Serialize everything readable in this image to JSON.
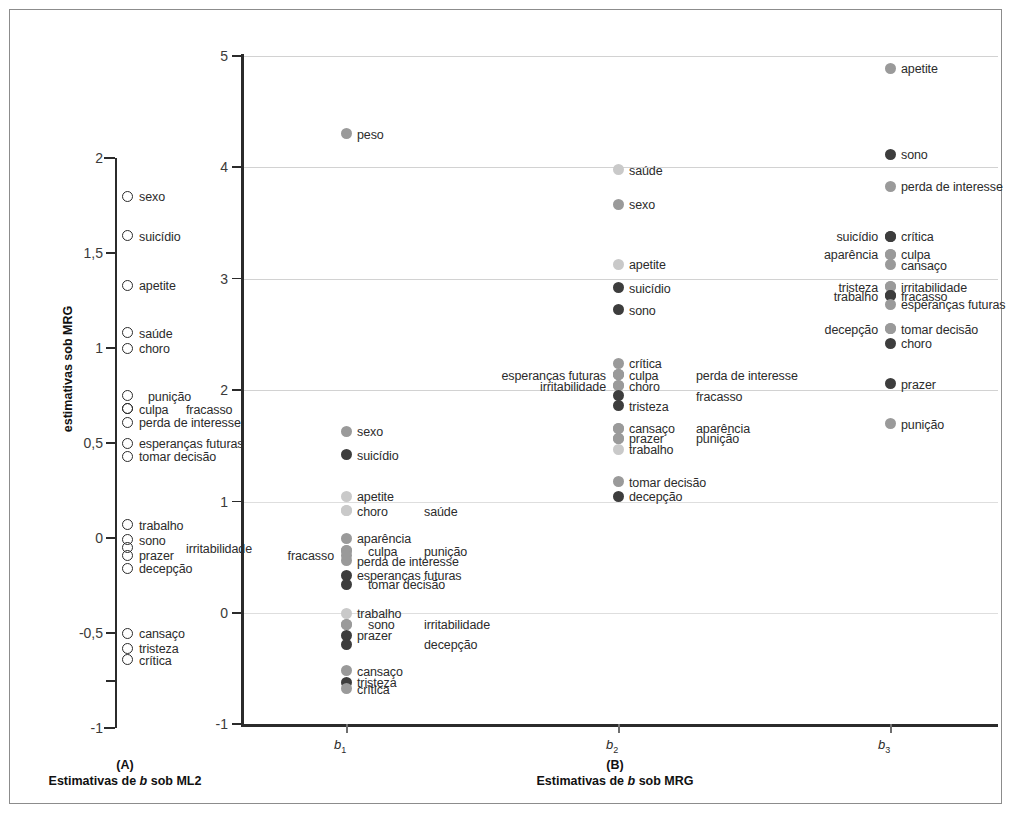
{
  "figure": {
    "panelA": {
      "caption_id": "(A)",
      "caption": "Estimativas de b sob ML2",
      "axis_ticks": [
        "2",
        "1,5",
        "1",
        "0,5",
        "0",
        "-0,5",
        "-1"
      ],
      "axis_values": [
        2,
        1.5,
        1,
        0.5,
        0,
        -0.5,
        -1
      ]
    },
    "panelB": {
      "caption_id": "(B)",
      "caption": "Estimativas de b sob MRG",
      "ylabel": "estimativas sob MRG",
      "axis_ticks": [
        "5",
        "4",
        "3",
        "2",
        "1",
        "0",
        "-1"
      ],
      "axis_values": [
        5,
        4,
        3,
        2,
        1,
        0,
        -1
      ],
      "xcats": [
        "b1",
        "b2",
        "b3"
      ]
    }
  },
  "colors": {
    "dark": "#3d3d3d",
    "medium": "#9a9a9a",
    "light": "#c9c9c9",
    "outline": "#2b2b2b",
    "grid": "#d2d2d2",
    "frame": "#8c8c8c"
  },
  "chart_data": {
    "type": "scatter",
    "title": "",
    "subtitle": "",
    "panels": [
      {
        "id": "A",
        "caption": "Estimativas de b sob ML2",
        "ylabel": "",
        "ylim": [
          -1,
          2
        ],
        "yticks": [
          2,
          1.5,
          1,
          0.5,
          0,
          -0.5,
          -1
        ],
        "ytick_labels": [
          "2",
          "1,5",
          "1",
          "0,5",
          "0",
          "-0,5",
          "-1"
        ],
        "grid": false,
        "marker": "open-circle",
        "points": [
          {
            "label": "sexo",
            "y": 1.8,
            "label_side": "right"
          },
          {
            "label": "suicídio",
            "y": 1.59,
            "label_side": "right"
          },
          {
            "label": "apetite",
            "y": 1.33,
            "label_side": "right"
          },
          {
            "label": "saúde",
            "y": 1.08,
            "label_side": "right"
          },
          {
            "label": "choro",
            "y": 1.0,
            "label_side": "right"
          },
          {
            "label": "punição",
            "y": 0.75,
            "label_side": "right-offset"
          },
          {
            "label": "culpa",
            "y": 0.68,
            "label_side": "right"
          },
          {
            "label": "fracasso",
            "y": 0.68,
            "label_side": "right-far"
          },
          {
            "label": "perda de interesse",
            "y": 0.61,
            "label_side": "right"
          },
          {
            "label": "esperanças futuras",
            "y": 0.5,
            "label_side": "right"
          },
          {
            "label": "tomar decisão",
            "y": 0.43,
            "label_side": "right"
          },
          {
            "label": "trabalho",
            "y": 0.07,
            "label_side": "right"
          },
          {
            "label": "sono",
            "y": -0.01,
            "label_side": "right"
          },
          {
            "label": "irritabilidade",
            "y": -0.05,
            "label_side": "right-far"
          },
          {
            "label": "prazer",
            "y": -0.09,
            "label_side": "right"
          },
          {
            "label": "decepção",
            "y": -0.16,
            "label_side": "right"
          },
          {
            "label": "cansaço",
            "y": -0.5,
            "label_side": "right"
          },
          {
            "label": "tristeza",
            "y": -0.58,
            "label_side": "right"
          },
          {
            "label": "crítica",
            "y": -0.64,
            "label_side": "right"
          }
        ]
      },
      {
        "id": "B",
        "caption": "Estimativas de b sob MRG",
        "ylabel": "estimativas sob MRG",
        "ylim": [
          -1,
          5
        ],
        "yticks": [
          5,
          4,
          3,
          2,
          1,
          0,
          -1
        ],
        "ytick_labels": [
          "5",
          "4",
          "3",
          "2",
          "1",
          "0",
          "-1"
        ],
        "xcats": [
          "b1",
          "b2",
          "b3"
        ],
        "grid": true,
        "marker": "filled-circle",
        "series": [
          {
            "name": "b1",
            "points": [
              {
                "label": "peso",
                "y": 4.3,
                "shade": "medium",
                "label_side": "right"
              },
              {
                "label": "sexo",
                "y": 1.63,
                "shade": "medium",
                "label_side": "right"
              },
              {
                "label": "suicídio",
                "y": 1.42,
                "shade": "dark",
                "label_side": "right"
              },
              {
                "label": "apetite",
                "y": 1.05,
                "shade": "light",
                "label_side": "right"
              },
              {
                "label": "choro",
                "y": 0.92,
                "shade": "light",
                "label_side": "right"
              },
              {
                "label": "saúde",
                "y": 0.92,
                "shade": "light",
                "label_side": "right-far"
              },
              {
                "label": "aparência",
                "y": 0.67,
                "shade": "medium",
                "label_side": "right"
              },
              {
                "label": "culpa",
                "y": 0.56,
                "shade": "medium",
                "label_side": "right-offset"
              },
              {
                "label": "punição",
                "y": 0.56,
                "shade": "medium",
                "label_side": "right-far"
              },
              {
                "label": "fracasso",
                "y": 0.52,
                "shade": "medium",
                "label_side": "left"
              },
              {
                "label": "perda de interesse",
                "y": 0.47,
                "shade": "medium",
                "label_side": "right"
              },
              {
                "label": "esperanças futuras",
                "y": 0.34,
                "shade": "dark",
                "label_side": "right"
              },
              {
                "label": "tomar decisão",
                "y": 0.26,
                "shade": "dark",
                "label_side": "right-offset"
              },
              {
                "label": "trabalho",
                "y": 0.0,
                "shade": "light",
                "label_side": "right"
              },
              {
                "label": "sono",
                "y": -0.1,
                "shade": "medium",
                "label_side": "right-offset"
              },
              {
                "label": "irritabilidade",
                "y": -0.1,
                "shade": "medium",
                "label_side": "right-far"
              },
              {
                "label": "prazer",
                "y": -0.2,
                "shade": "dark",
                "label_side": "right"
              },
              {
                "label": "decepção",
                "y": -0.28,
                "shade": "dark",
                "label_side": "right-far"
              },
              {
                "label": "cansaço",
                "y": -0.52,
                "shade": "medium",
                "label_side": "right"
              },
              {
                "label": "tristeza",
                "y": -0.62,
                "shade": "dark",
                "label_side": "right"
              },
              {
                "label": "crítica",
                "y": -0.68,
                "shade": "medium",
                "label_side": "right"
              }
            ]
          },
          {
            "name": "b2",
            "points": [
              {
                "label": "saúde",
                "y": 3.98,
                "shade": "light",
                "label_side": "right"
              },
              {
                "label": "sexo",
                "y": 3.67,
                "shade": "medium",
                "label_side": "right"
              },
              {
                "label": "apetite",
                "y": 3.13,
                "shade": "light",
                "label_side": "right"
              },
              {
                "label": "suicídio",
                "y": 2.92,
                "shade": "dark",
                "label_side": "right"
              },
              {
                "label": "sono",
                "y": 2.72,
                "shade": "dark",
                "label_side": "right"
              },
              {
                "label": "crítica",
                "y": 2.24,
                "shade": "medium",
                "label_side": "right"
              },
              {
                "label": "esperanças futuras",
                "y": 2.14,
                "shade": "medium",
                "label_side": "left"
              },
              {
                "label": "culpa",
                "y": 2.14,
                "shade": "medium",
                "label_side": "right"
              },
              {
                "label": "perda de interesse",
                "y": 2.14,
                "shade": "medium",
                "label_side": "right-far"
              },
              {
                "label": "irritabilidade",
                "y": 2.04,
                "shade": "medium",
                "label_side": "left"
              },
              {
                "label": "choro",
                "y": 2.04,
                "shade": "medium",
                "label_side": "right"
              },
              {
                "label": "fracasso",
                "y": 1.95,
                "shade": "dark",
                "label_side": "right-far"
              },
              {
                "label": "tristeza",
                "y": 1.86,
                "shade": "dark",
                "label_side": "right"
              },
              {
                "label": "cansaço",
                "y": 1.66,
                "shade": "medium",
                "label_side": "right"
              },
              {
                "label": "aparência",
                "y": 1.66,
                "shade": "medium",
                "label_side": "right-far"
              },
              {
                "label": "prazer",
                "y": 1.57,
                "shade": "medium",
                "label_side": "right"
              },
              {
                "label": "punição",
                "y": 1.57,
                "shade": "medium",
                "label_side": "right-far"
              },
              {
                "label": "trabalho",
                "y": 1.47,
                "shade": "light",
                "label_side": "right"
              },
              {
                "label": "tomar decisão",
                "y": 1.18,
                "shade": "medium",
                "label_side": "right"
              },
              {
                "label": "decepção",
                "y": 1.05,
                "shade": "dark",
                "label_side": "right"
              }
            ]
          },
          {
            "name": "b3",
            "points": [
              {
                "label": "apetite",
                "y": 4.89,
                "shade": "medium",
                "label_side": "right"
              },
              {
                "label": "sono",
                "y": 4.12,
                "shade": "dark",
                "label_side": "right"
              },
              {
                "label": "perda de interesse",
                "y": 3.83,
                "shade": "medium",
                "label_side": "right"
              },
              {
                "label": "crítica",
                "y": 3.38,
                "shade": "dark",
                "label_side": "right"
              },
              {
                "label": "suicídio",
                "y": 3.38,
                "shade": "dark",
                "label_side": "left"
              },
              {
                "label": "culpa",
                "y": 3.22,
                "shade": "medium",
                "label_side": "right"
              },
              {
                "label": "aparência",
                "y": 3.22,
                "shade": "medium",
                "label_side": "left"
              },
              {
                "label": "cansaço",
                "y": 3.13,
                "shade": "medium",
                "label_side": "right-below"
              },
              {
                "label": "irritabilidade",
                "y": 2.93,
                "shade": "medium",
                "label_side": "right"
              },
              {
                "label": "tristeza",
                "y": 2.93,
                "shade": "medium",
                "label_side": "left"
              },
              {
                "label": "fracasso",
                "y": 2.85,
                "shade": "dark",
                "label_side": "right"
              },
              {
                "label": "trabalho",
                "y": 2.85,
                "shade": "dark",
                "label_side": "left"
              },
              {
                "label": "esperanças futuras",
                "y": 2.77,
                "shade": "medium",
                "label_side": "right"
              },
              {
                "label": "tomar decisão",
                "y": 2.55,
                "shade": "medium",
                "label_side": "right"
              },
              {
                "label": "decepção",
                "y": 2.55,
                "shade": "medium",
                "label_side": "left"
              },
              {
                "label": "choro",
                "y": 2.42,
                "shade": "dark",
                "label_side": "right"
              },
              {
                "label": "prazer",
                "y": 2.06,
                "shade": "dark",
                "label_side": "right"
              },
              {
                "label": "punição",
                "y": 1.7,
                "shade": "medium",
                "label_side": "right"
              }
            ]
          }
        ]
      }
    ]
  }
}
